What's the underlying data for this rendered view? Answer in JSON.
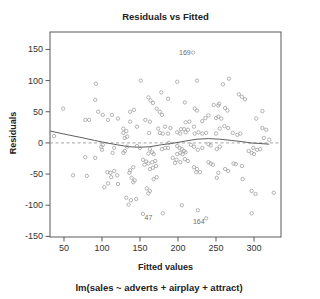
{
  "chart_data": {
    "type": "scatter",
    "title": "Residuals vs Fitted",
    "xlabel": "Fitted values",
    "ylabel": "Residuals",
    "subtitle": "lm(sales ~ adverts + airplay + attract)",
    "xlim": [
      31.6,
      335.5
    ],
    "ylim": [
      -151,
      178
    ],
    "xticks": [
      50,
      100,
      150,
      200,
      250,
      300
    ],
    "yticks": [
      150,
      100,
      50,
      0,
      -50,
      -100,
      -150
    ],
    "zero_line": 0,
    "grid": false,
    "legend": "none",
    "colors": {
      "point_stroke": "#9c9c9c",
      "smooth_line": "#4d4d4d",
      "zero_line": "#999999",
      "axis": "#5a5a5a",
      "text": "#333333",
      "outlier_label": "#6e6e6e",
      "background": "#ffffff"
    },
    "points": [
      [
        49,
        55
      ],
      [
        37,
        11
      ],
      [
        92,
        95
      ],
      [
        91,
        69
      ],
      [
        151,
        100
      ],
      [
        161,
        73
      ],
      [
        164,
        68
      ],
      [
        167,
        64
      ],
      [
        172,
        55
      ],
      [
        78,
        37
      ],
      [
        83,
        37
      ],
      [
        95,
        50
      ],
      [
        101,
        45
      ],
      [
        113,
        45
      ],
      [
        108,
        37
      ],
      [
        121,
        39
      ],
      [
        137,
        50
      ],
      [
        142,
        53
      ],
      [
        137,
        34
      ],
      [
        146,
        26
      ],
      [
        157,
        37
      ],
      [
        163,
        34
      ],
      [
        176,
        50
      ],
      [
        179,
        45
      ],
      [
        183,
        26
      ],
      [
        174,
        23
      ],
      [
        128,
        23
      ],
      [
        132,
        19
      ],
      [
        199,
        98
      ],
      [
        225,
        100
      ],
      [
        267,
        103
      ],
      [
        259,
        94
      ],
      [
        187,
        71
      ],
      [
        178,
        81
      ],
      [
        209,
        65
      ],
      [
        222,
        55
      ],
      [
        225,
        52
      ],
      [
        240,
        44
      ],
      [
        280,
        78
      ],
      [
        284,
        74
      ],
      [
        288,
        70
      ],
      [
        254,
        63
      ],
      [
        247,
        61
      ],
      [
        253,
        60
      ],
      [
        262,
        56
      ],
      [
        265,
        52
      ],
      [
        250,
        40
      ],
      [
        257,
        39
      ],
      [
        253,
        42
      ],
      [
        236,
        40
      ],
      [
        232,
        35
      ],
      [
        210,
        33
      ],
      [
        215,
        34
      ],
      [
        204,
        22
      ],
      [
        208,
        22
      ],
      [
        213,
        21
      ],
      [
        221,
        26
      ],
      [
        190,
        24
      ],
      [
        255,
        23
      ],
      [
        261,
        27
      ],
      [
        266,
        24
      ],
      [
        250,
        15
      ],
      [
        311,
        51
      ],
      [
        303,
        39
      ],
      [
        311,
        24
      ],
      [
        316,
        21
      ],
      [
        128,
        16
      ],
      [
        133,
        10
      ],
      [
        130,
        8
      ],
      [
        162,
        16
      ],
      [
        176,
        16
      ],
      [
        180,
        15
      ],
      [
        101,
        -3
      ],
      [
        99,
        -6
      ],
      [
        100,
        -11
      ],
      [
        116,
        -8
      ],
      [
        114,
        -16
      ],
      [
        133,
        -6
      ],
      [
        130,
        -13
      ],
      [
        128,
        -16
      ],
      [
        146,
        -5
      ],
      [
        150,
        -8
      ],
      [
        163,
        -10
      ],
      [
        166,
        -15
      ],
      [
        161,
        -17
      ],
      [
        168,
        -18
      ],
      [
        179,
        -10
      ],
      [
        183,
        -8
      ],
      [
        187,
        15
      ],
      [
        199,
        17
      ],
      [
        203,
        15
      ],
      [
        210,
        17
      ],
      [
        222,
        15
      ],
      [
        227,
        17
      ],
      [
        232,
        15
      ],
      [
        237,
        16
      ],
      [
        272,
        16
      ],
      [
        278,
        13
      ],
      [
        282,
        15
      ],
      [
        313,
        8
      ],
      [
        320,
        5
      ],
      [
        188,
        0
      ],
      [
        187,
        -8
      ],
      [
        199,
        -5
      ],
      [
        202,
        -8
      ],
      [
        205,
        -10
      ],
      [
        208,
        -13
      ],
      [
        203,
        -16
      ],
      [
        199,
        -18
      ],
      [
        206,
        -18
      ],
      [
        210,
        -15
      ],
      [
        217,
        -3
      ],
      [
        221,
        -6
      ],
      [
        226,
        -11
      ],
      [
        232,
        -8
      ],
      [
        240,
        -2
      ],
      [
        243,
        -4
      ],
      [
        251,
        -10
      ],
      [
        255,
        -6
      ],
      [
        293,
        -13
      ],
      [
        297,
        -16
      ],
      [
        300,
        -18
      ],
      [
        299,
        -8
      ],
      [
        304,
        -11
      ],
      [
        308,
        -10
      ],
      [
        78,
        -23
      ],
      [
        91,
        -24
      ],
      [
        62,
        -52
      ],
      [
        80,
        -53
      ],
      [
        107,
        -47
      ],
      [
        111,
        -48
      ],
      [
        116,
        -45
      ],
      [
        120,
        -52
      ],
      [
        112,
        -55
      ],
      [
        108,
        -65
      ],
      [
        121,
        -66
      ],
      [
        103,
        -71
      ],
      [
        137,
        -44
      ],
      [
        141,
        -39
      ],
      [
        136,
        -48
      ],
      [
        143,
        -60
      ],
      [
        141,
        -63
      ],
      [
        139,
        -56
      ],
      [
        154,
        -27
      ],
      [
        158,
        -30
      ],
      [
        156,
        -35
      ],
      [
        161,
        -33
      ],
      [
        166,
        -31
      ],
      [
        170,
        -29
      ],
      [
        171,
        -37
      ],
      [
        163,
        -42
      ],
      [
        167,
        -40
      ],
      [
        172,
        -55
      ],
      [
        168,
        -58
      ],
      [
        159,
        -73
      ],
      [
        163,
        -77
      ],
      [
        161,
        -81
      ],
      [
        193,
        -24
      ],
      [
        198,
        -27
      ],
      [
        196,
        -32
      ],
      [
        203,
        -31
      ],
      [
        209,
        -26
      ],
      [
        213,
        -29
      ],
      [
        221,
        -39
      ],
      [
        225,
        -42
      ],
      [
        224,
        -47
      ],
      [
        229,
        -47
      ],
      [
        240,
        -31
      ],
      [
        243,
        -33
      ],
      [
        246,
        -35
      ],
      [
        253,
        -48
      ],
      [
        251,
        -56
      ],
      [
        262,
        -42
      ],
      [
        266,
        -45
      ],
      [
        273,
        -33
      ],
      [
        276,
        -34
      ],
      [
        284,
        -37
      ],
      [
        285,
        -58
      ],
      [
        297,
        -77
      ],
      [
        302,
        -82
      ],
      [
        326,
        -80
      ],
      [
        132,
        -88
      ],
      [
        138,
        -92
      ],
      [
        135,
        -99
      ],
      [
        145,
        -90
      ],
      [
        205,
        -100
      ],
      [
        226,
        -108
      ],
      [
        180,
        -113
      ],
      [
        297,
        -113
      ]
    ],
    "labeled_points": [
      {
        "label": "169",
        "x": 220,
        "y": 145,
        "side": "left"
      },
      {
        "label": "47",
        "x": 154,
        "y": -114,
        "side": "lower-right"
      },
      {
        "label": "164",
        "x": 237,
        "y": -121,
        "side": "lower-left"
      }
    ],
    "smooth_line": [
      [
        32,
        19
      ],
      [
        55,
        13
      ],
      [
        75,
        8
      ],
      [
        90,
        4
      ],
      [
        106,
        0
      ],
      [
        120,
        -3
      ],
      [
        135,
        -6
      ],
      [
        150,
        -7
      ],
      [
        163,
        -6
      ],
      [
        178,
        -3
      ],
      [
        196,
        0
      ],
      [
        210,
        3
      ],
      [
        225,
        6
      ],
      [
        240,
        7
      ],
      [
        255,
        6
      ],
      [
        270,
        4
      ],
      [
        285,
        2
      ],
      [
        295,
        0
      ],
      [
        308,
        -1
      ],
      [
        320,
        -2
      ]
    ]
  }
}
